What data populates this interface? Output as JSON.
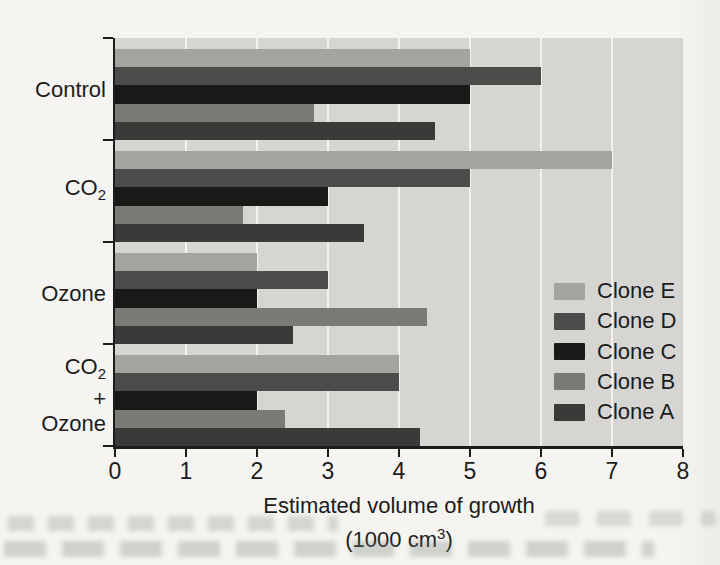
{
  "figure": {
    "page_background": "#f5f4f0",
    "plot_background": "#d6d5d1",
    "gridline_color": "#f3f2ee",
    "axis_color": "#1c1c1c"
  },
  "chart_data": {
    "type": "bar",
    "orientation": "horizontal",
    "title": "",
    "xlabel_line1": "Estimated volume of growth",
    "xlabel_line2": "(1000 cm³)",
    "xlim": [
      0,
      8
    ],
    "xticks": [
      0,
      1,
      2,
      3,
      4,
      5,
      6,
      7,
      8
    ],
    "grid": "vertical white gridlines at each integer tick",
    "bar_order_note": "bars within each group run top-to-bottom in series order (Clone E topmost, Clone A bottom)",
    "groups": [
      {
        "label_lines": [
          "Control"
        ]
      },
      {
        "label_lines": [
          "CO₂"
        ]
      },
      {
        "label_lines": [
          "Ozone"
        ]
      },
      {
        "label_lines": [
          "CO₂",
          "+",
          "Ozone"
        ]
      }
    ],
    "series": [
      {
        "name": "Clone E",
        "color": "#a4a3a0",
        "values": [
          5.0,
          7.0,
          2.0,
          4.0
        ]
      },
      {
        "name": "Clone D",
        "color": "#4d4c4a",
        "values": [
          6.0,
          5.0,
          3.0,
          4.0
        ]
      },
      {
        "name": "Clone C",
        "color": "#191918",
        "values": [
          5.0,
          3.0,
          2.0,
          2.0
        ]
      },
      {
        "name": "Clone B",
        "color": "#7b7a77",
        "values": [
          2.8,
          1.8,
          4.4,
          2.4
        ]
      },
      {
        "name": "Clone A",
        "color": "#3a3a38",
        "values": [
          4.5,
          3.5,
          2.5,
          4.3
        ]
      }
    ],
    "legend": {
      "position": "inside plot, lower right",
      "order_top_to_bottom": [
        "Clone E",
        "Clone D",
        "Clone C",
        "Clone B",
        "Clone A"
      ]
    }
  }
}
